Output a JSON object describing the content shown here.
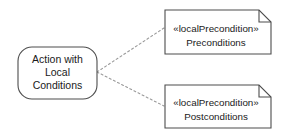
{
  "diagram": {
    "background_color": "#ffffff",
    "stroke_color": "#4d4d4d",
    "connector_color": "#9a9a9a",
    "text_color": "#1a1a1a",
    "action_node": {
      "name": "action-with-local-conditions",
      "shape": "rounded-rectangle",
      "lines": [
        "Action with",
        "Local",
        "Conditions"
      ],
      "x": 18,
      "y": 47,
      "width": 79,
      "height": 52,
      "corner_radius": 14
    },
    "notes": [
      {
        "name": "precondition-note",
        "shape": "note",
        "stereotype": "«localPrecondition»",
        "body": "Preconditions",
        "x": 165,
        "y": 10,
        "width": 106,
        "height": 44,
        "fold_size": 12
      },
      {
        "name": "postcondition-note",
        "shape": "note",
        "stereotype": "«localPrecondition»",
        "body": "Postconditions",
        "x": 165,
        "y": 85,
        "width": 106,
        "height": 43,
        "fold_size": 12
      }
    ],
    "connectors": [
      {
        "name": "connector-to-precondition-note",
        "style": "dashed",
        "from": {
          "x": 97,
          "y": 72
        },
        "to": {
          "x": 164,
          "y": 28
        }
      },
      {
        "name": "connector-to-postcondition-note",
        "style": "dashed",
        "from": {
          "x": 97,
          "y": 72
        },
        "to": {
          "x": 164,
          "y": 106
        }
      }
    ]
  }
}
